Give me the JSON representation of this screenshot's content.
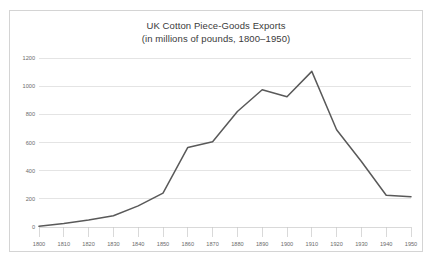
{
  "chart_data": {
    "type": "line",
    "title": "UK Cotton Piece-Goods Exports",
    "subtitle": "(in millions of pounds, 1800–1950)",
    "xlabel": "",
    "ylabel": "",
    "x": [
      1800,
      1810,
      1820,
      1830,
      1840,
      1850,
      1860,
      1870,
      1880,
      1890,
      1900,
      1910,
      1920,
      1930,
      1940,
      1950
    ],
    "categories": [
      "1800",
      "1810",
      "1820",
      "1830",
      "1840",
      "1850",
      "1860",
      "1870",
      "1880",
      "1890",
      "1900",
      "1910",
      "1920",
      "1930",
      "1940",
      "1950"
    ],
    "values": [
      5,
      25,
      50,
      80,
      150,
      240,
      565,
      605,
      820,
      975,
      925,
      1105,
      690,
      465,
      225,
      215
    ],
    "series": [
      {
        "name": "UK Cotton Piece-Goods Exports",
        "color": "#595959",
        "values": [
          5,
          25,
          50,
          80,
          150,
          240,
          565,
          605,
          820,
          975,
          925,
          1105,
          690,
          465,
          225,
          215
        ]
      }
    ],
    "ylim": [
      0,
      1200
    ],
    "xlim": [
      1800,
      1950
    ],
    "yticks": [
      0,
      200,
      400,
      600,
      800,
      1000,
      1200
    ],
    "ytick_labels": [
      "0",
      "200",
      "400",
      "600",
      "800",
      "1000",
      "1200"
    ],
    "xticks": [
      1800,
      1810,
      1820,
      1830,
      1840,
      1850,
      1860,
      1870,
      1880,
      1890,
      1900,
      1910,
      1920,
      1930,
      1940,
      1950
    ],
    "xtick_labels": [
      "1800",
      "1810",
      "1820",
      "1830",
      "1840",
      "1850",
      "1860",
      "1870",
      "1880",
      "1890",
      "1900",
      "1910",
      "1920",
      "1930",
      "1940",
      "1950"
    ],
    "grid": {
      "horizontal": true,
      "vertical": false,
      "color": "#d9d9d9"
    },
    "legend": {
      "visible": false,
      "position": "none"
    },
    "colors": {
      "line": "#595959",
      "grid": "#d9d9d9",
      "axis": "#c9c9c9",
      "frame": "#d4d4d4",
      "tick_text": "#6b6b6b",
      "title_text": "#3a3a3a",
      "background": "#ffffff"
    }
  }
}
